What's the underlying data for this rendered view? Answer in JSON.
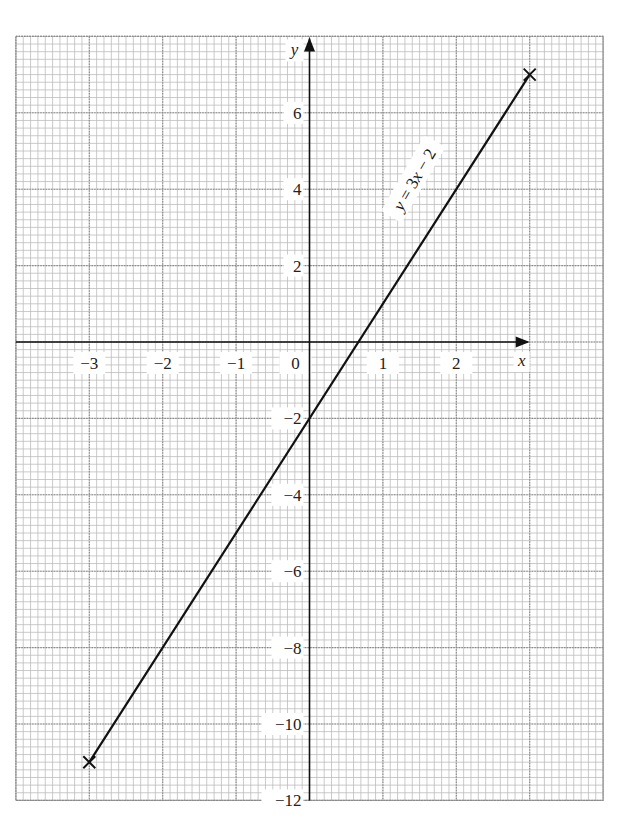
{
  "chart_data": {
    "type": "line",
    "title": "",
    "xlabel": "x",
    "ylabel": "y",
    "xlim": [
      -4,
      4
    ],
    "ylim": [
      -12,
      8
    ],
    "grid": true,
    "grid_minor_x_step": 0.1,
    "grid_minor_y_step": 0.2,
    "x_ticks": [
      -3,
      -2,
      -1,
      0,
      1,
      2
    ],
    "x_tick_labels": [
      "−3",
      "−2",
      "−1",
      "0",
      "1",
      "2"
    ],
    "y_ticks": [
      6,
      4,
      2,
      -2,
      -4,
      -6,
      -8,
      -10,
      -12
    ],
    "y_tick_labels": [
      "6",
      "4",
      "2",
      "−2",
      "−4",
      "−6",
      "−8",
      "−10",
      "−12"
    ],
    "series": [
      {
        "name": "y = 3x − 2",
        "equation": "y = 3x - 2",
        "x": [
          -3,
          3
        ],
        "y": [
          -11,
          7
        ],
        "markers": "cross-at-endpoints",
        "color": "#111111"
      }
    ],
    "annotations": [
      {
        "text": "y = 3x − 2",
        "position": "along line, upper right",
        "rotation_deg": -60
      }
    ]
  },
  "style": {
    "minor_grid_color": "#bdbdbd",
    "major_grid_color": "#8a8a8a",
    "axis_color": "#111111",
    "line_color": "#111111"
  },
  "layout": {
    "origin_px": [
      309.5,
      342
    ],
    "x_unit_px": 73.4,
    "y_unit_px": 38.2
  }
}
